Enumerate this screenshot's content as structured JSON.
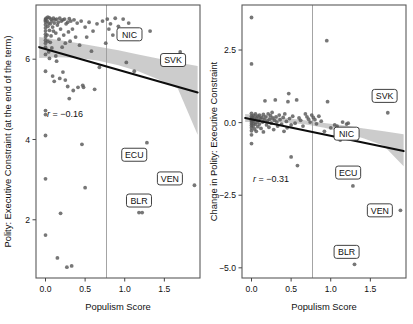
{
  "figure": {
    "panels": [
      {
        "id": "left",
        "ylabel": "Polity: Executive Constraint (at the end of the term)",
        "xlabel": "Populism Score",
        "annotation": "r = −0.16"
      },
      {
        "id": "right",
        "ylabel": "Change in Polity: Executive Constraint",
        "xlabel": "Populism Score",
        "annotation": "r = −0.31"
      }
    ]
  },
  "chart_data": [
    {
      "type": "scatter",
      "panel": "left",
      "title": "",
      "xlabel": "Populism Score",
      "ylabel": "Polity: Executive Constraint (at the end of the term)",
      "xlim": [
        -0.12,
        1.95
      ],
      "ylim": [
        0.55,
        7.35
      ],
      "xticks": [
        0.0,
        0.5,
        1.0,
        1.5
      ],
      "xticklabels": [
        "0.0",
        "0.5",
        "1.0",
        "1.5"
      ],
      "yticks": [
        2,
        4,
        6
      ],
      "yticklabels": [
        "2",
        "4",
        "6"
      ],
      "grid": false,
      "legend": null,
      "annotations": [
        {
          "text": "r = −0.16",
          "x": 0.02,
          "y": 4.55,
          "italic_r": true
        }
      ],
      "reference_line": {
        "orientation": "vertical",
        "x": 0.77,
        "color": "#9a9a9a"
      },
      "point_color": "#595959",
      "fit_line": {
        "color": "#0d0d0d",
        "x": [
          -0.08,
          1.92
        ],
        "y": [
          6.3,
          5.17
        ],
        "band_color": "#bfbfbf",
        "band_upper": [
          6.55,
          6.48,
          6.4,
          6.31,
          6.22,
          6.12,
          6.02,
          5.92,
          5.83
        ],
        "band_lower": [
          6.03,
          6.05,
          6.03,
          5.96,
          5.85,
          5.7,
          5.5,
          5.27,
          4.12
        ],
        "band_x": [
          -0.08,
          0.17,
          0.42,
          0.67,
          0.92,
          1.17,
          1.42,
          1.67,
          1.92
        ]
      },
      "labels": [
        {
          "text": "NIC",
          "x": 1.06,
          "y": 6.62
        },
        {
          "text": "SVK",
          "x": 1.61,
          "y": 5.98
        },
        {
          "text": "ECU",
          "x": 1.12,
          "y": 3.62
        },
        {
          "text": "VEN",
          "x": 1.57,
          "y": 3.03
        },
        {
          "text": "BLR",
          "x": 1.18,
          "y": 2.48
        }
      ],
      "points": [
        [
          0.0,
          7.0
        ],
        [
          0.0,
          6.97
        ],
        [
          0.0,
          6.93
        ],
        [
          0.0,
          6.86
        ],
        [
          0.0,
          6.78
        ],
        [
          0.0,
          6.7
        ],
        [
          0.0,
          6.62
        ],
        [
          0.0,
          6.55
        ],
        [
          0.0,
          6.47
        ],
        [
          0.0,
          6.4
        ],
        [
          0.0,
          6.3
        ],
        [
          0.0,
          6.12
        ],
        [
          0.0,
          5.7
        ],
        [
          0.0,
          4.72
        ],
        [
          0.0,
          4.62
        ],
        [
          0.0,
          4.1
        ],
        [
          0.0,
          3.02
        ],
        [
          0.0,
          1.62
        ],
        [
          0.01,
          7.02
        ],
        [
          0.02,
          6.95
        ],
        [
          0.02,
          6.6
        ],
        [
          0.03,
          7.05
        ],
        [
          0.03,
          6.82
        ],
        [
          0.03,
          6.45
        ],
        [
          0.04,
          6.9
        ],
        [
          0.04,
          6.18
        ],
        [
          0.05,
          7.03
        ],
        [
          0.05,
          6.72
        ],
        [
          0.05,
          6.02
        ],
        [
          0.06,
          6.88
        ],
        [
          0.06,
          6.42
        ],
        [
          0.07,
          7.0
        ],
        [
          0.07,
          6.58
        ],
        [
          0.08,
          6.95
        ],
        [
          0.08,
          6.28
        ],
        [
          0.09,
          6.8
        ],
        [
          0.09,
          5.58
        ],
        [
          0.1,
          7.02
        ],
        [
          0.1,
          6.7
        ],
        [
          0.11,
          6.9
        ],
        [
          0.11,
          5.45
        ],
        [
          0.12,
          6.98
        ],
        [
          0.13,
          6.65
        ],
        [
          0.13,
          6.08
        ],
        [
          0.14,
          7.0
        ],
        [
          0.14,
          5.95
        ],
        [
          0.15,
          6.85
        ],
        [
          0.15,
          1.05
        ],
        [
          0.16,
          6.92
        ],
        [
          0.17,
          6.5
        ],
        [
          0.18,
          7.02
        ],
        [
          0.18,
          5.52
        ],
        [
          0.19,
          6.75
        ],
        [
          0.19,
          2.16
        ],
        [
          0.2,
          6.95
        ],
        [
          0.21,
          6.3
        ],
        [
          0.22,
          6.98
        ],
        [
          0.22,
          5.68
        ],
        [
          0.23,
          6.6
        ],
        [
          0.24,
          7.0
        ],
        [
          0.25,
          6.4
        ],
        [
          0.25,
          5.48
        ],
        [
          0.26,
          6.88
        ],
        [
          0.27,
          0.82
        ],
        [
          0.28,
          6.92
        ],
        [
          0.28,
          5.32
        ],
        [
          0.29,
          6.68
        ],
        [
          0.3,
          7.01
        ],
        [
          0.3,
          5.02
        ],
        [
          0.31,
          6.45
        ],
        [
          0.32,
          6.95
        ],
        [
          0.33,
          0.85
        ],
        [
          0.34,
          6.75
        ],
        [
          0.35,
          5.22
        ],
        [
          0.36,
          6.98
        ],
        [
          0.38,
          6.55
        ],
        [
          0.4,
          6.9
        ],
        [
          0.41,
          5.3
        ],
        [
          0.43,
          6.35
        ],
        [
          0.45,
          6.95
        ],
        [
          0.46,
          3.88
        ],
        [
          0.47,
          5.35
        ],
        [
          0.48,
          5.3
        ],
        [
          0.5,
          6.8
        ],
        [
          0.5,
          2.8
        ],
        [
          0.52,
          6.55
        ],
        [
          0.55,
          6.92
        ],
        [
          0.58,
          6.2
        ],
        [
          0.6,
          6.7
        ],
        [
          0.62,
          5.25
        ],
        [
          0.65,
          6.88
        ],
        [
          0.68,
          5.8
        ],
        [
          0.72,
          6.95
        ],
        [
          0.76,
          6.4
        ],
        [
          0.78,
          7.0
        ],
        [
          0.8,
          6.75
        ],
        [
          0.82,
          6.88
        ],
        [
          0.85,
          6.6
        ],
        [
          0.88,
          7.02
        ],
        [
          0.92,
          6.82
        ],
        [
          0.95,
          6.68
        ],
        [
          0.98,
          7.0
        ],
        [
          1.02,
          5.92
        ],
        [
          1.05,
          6.9
        ],
        [
          1.12,
          5.7
        ],
        [
          1.18,
          2.18
        ],
        [
          1.22,
          2.18
        ],
        [
          1.28,
          3.92
        ],
        [
          1.32,
          6.7
        ],
        [
          1.7,
          6.18
        ],
        [
          1.88,
          2.86
        ]
      ]
    },
    {
      "type": "scatter",
      "panel": "right",
      "title": "",
      "xlabel": "Populism Score",
      "ylabel": "Change in Polity: Executive Constraint",
      "xlim": [
        -0.12,
        1.95
      ],
      "ylim": [
        -5.35,
        4.05
      ],
      "xticks": [
        0.0,
        0.5,
        1.0,
        1.5
      ],
      "xticklabels": [
        "0.0",
        "0.5",
        "1.0",
        "1.5"
      ],
      "yticks": [
        2.5,
        0.0,
        -2.5,
        -5.0
      ],
      "yticklabels": [
        "2.5",
        "0.0",
        "−2.5",
        "−5.0"
      ],
      "grid": false,
      "legend": null,
      "annotations": [
        {
          "text": "r = −0.31",
          "x": 0.02,
          "y": -2.05,
          "italic_r": true
        }
      ],
      "reference_line": {
        "orientation": "vertical",
        "x": 0.77,
        "color": "#9a9a9a"
      },
      "point_color": "#595959",
      "fit_line": {
        "color": "#0d0d0d",
        "x": [
          -0.08,
          1.92
        ],
        "y": [
          0.16,
          -0.98
        ],
        "band_color": "#bfbfbf",
        "band_upper": [
          0.3,
          0.24,
          0.16,
          0.08,
          -0.01,
          -0.1,
          -0.2,
          -0.3,
          -0.4
        ],
        "band_lower": [
          0.02,
          0.02,
          0.0,
          -0.06,
          -0.18,
          -0.34,
          -0.55,
          -0.8,
          -1.5
        ],
        "band_x": [
          -0.08,
          0.17,
          0.42,
          0.67,
          0.92,
          1.17,
          1.42,
          1.67,
          1.92
        ]
      },
      "labels": [
        {
          "text": "SVK",
          "x": 1.68,
          "y": 0.92
        },
        {
          "text": "NIC",
          "x": 1.2,
          "y": -0.38
        },
        {
          "text": "ECU",
          "x": 1.22,
          "y": -1.72
        },
        {
          "text": "VEN",
          "x": 1.62,
          "y": -3.02
        },
        {
          "text": "BLR",
          "x": 1.2,
          "y": -4.45
        }
      ],
      "points": [
        [
          0.0,
          3.62
        ],
        [
          0.0,
          2.02
        ],
        [
          0.0,
          0.32
        ],
        [
          0.0,
          0.22
        ],
        [
          0.0,
          0.14
        ],
        [
          0.0,
          0.08
        ],
        [
          0.0,
          0.02
        ],
        [
          0.0,
          -0.04
        ],
        [
          0.0,
          -0.1
        ],
        [
          0.0,
          -0.18
        ],
        [
          0.0,
          -0.28
        ],
        [
          0.0,
          -0.42
        ],
        [
          0.0,
          -0.72
        ],
        [
          0.01,
          0.18
        ],
        [
          0.02,
          0.05
        ],
        [
          0.02,
          -0.12
        ],
        [
          0.03,
          0.24
        ],
        [
          0.03,
          -0.02
        ],
        [
          0.04,
          0.12
        ],
        [
          0.04,
          -0.22
        ],
        [
          0.05,
          0.3
        ],
        [
          0.05,
          -0.06
        ],
        [
          0.06,
          0.16
        ],
        [
          0.06,
          -0.3
        ],
        [
          0.07,
          0.02
        ],
        [
          0.08,
          0.22
        ],
        [
          0.08,
          -0.14
        ],
        [
          0.09,
          0.08
        ],
        [
          0.1,
          0.26
        ],
        [
          0.1,
          -0.05
        ],
        [
          0.11,
          0.14
        ],
        [
          0.12,
          -0.2
        ],
        [
          0.13,
          0.18
        ],
        [
          0.14,
          0.02
        ],
        [
          0.15,
          0.28
        ],
        [
          0.15,
          -0.32
        ],
        [
          0.16,
          0.1
        ],
        [
          0.17,
          0.75
        ],
        [
          0.18,
          0.2
        ],
        [
          0.19,
          -0.08
        ],
        [
          0.2,
          0.06
        ],
        [
          0.21,
          0.3
        ],
        [
          0.22,
          -0.16
        ],
        [
          0.23,
          0.12
        ],
        [
          0.24,
          0.24
        ],
        [
          0.25,
          -0.02
        ],
        [
          0.26,
          0.35
        ],
        [
          0.27,
          0.16
        ],
        [
          0.28,
          -0.24
        ],
        [
          0.29,
          0.08
        ],
        [
          0.3,
          0.78
        ],
        [
          0.31,
          0.2
        ],
        [
          0.32,
          0.02
        ],
        [
          0.33,
          -0.12
        ],
        [
          0.35,
          0.26
        ],
        [
          0.36,
          0.1
        ],
        [
          0.38,
          -0.05
        ],
        [
          0.4,
          0.18
        ],
        [
          0.41,
          -0.3
        ],
        [
          0.42,
          0.3
        ],
        [
          0.44,
          0.04
        ],
        [
          0.45,
          -0.18
        ],
        [
          0.46,
          0.72
        ],
        [
          0.47,
          1.0
        ],
        [
          0.48,
          0.14
        ],
        [
          0.5,
          -0.08
        ],
        [
          0.5,
          -1.18
        ],
        [
          0.52,
          0.22
        ],
        [
          0.55,
          -0.02
        ],
        [
          0.57,
          0.78
        ],
        [
          0.58,
          -1.48
        ],
        [
          0.6,
          0.16
        ],
        [
          0.62,
          0.08
        ],
        [
          0.65,
          -0.12
        ],
        [
          0.68,
          0.3
        ],
        [
          0.7,
          0.2
        ],
        [
          0.72,
          0.12
        ],
        [
          0.74,
          0.02
        ],
        [
          0.76,
          0.26
        ],
        [
          0.78,
          0.18
        ],
        [
          0.8,
          0.1
        ],
        [
          0.82,
          -0.04
        ],
        [
          0.85,
          0.22
        ],
        [
          0.88,
          0.05
        ],
        [
          0.92,
          -0.3
        ],
        [
          0.95,
          2.82
        ],
        [
          0.96,
          0.72
        ],
        [
          1.0,
          -0.18
        ],
        [
          1.05,
          -0.08
        ],
        [
          1.08,
          -0.12
        ],
        [
          1.12,
          -0.6
        ],
        [
          1.15,
          0.02
        ],
        [
          1.2,
          -0.05
        ],
        [
          1.22,
          -0.02
        ],
        [
          1.28,
          -2.18
        ],
        [
          1.3,
          -4.88
        ],
        [
          1.32,
          -0.6
        ],
        [
          1.72,
          0.34
        ],
        [
          1.88,
          -3.02
        ]
      ]
    }
  ]
}
